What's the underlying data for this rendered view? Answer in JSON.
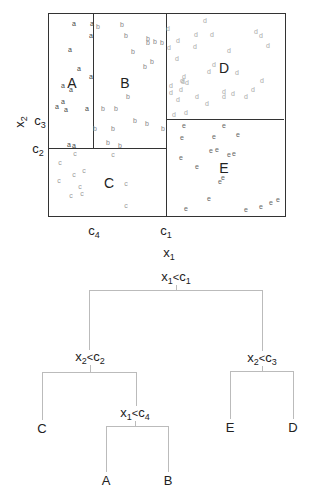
{
  "figure": {
    "partition_plot": {
      "box": {
        "left": 48,
        "top": 13,
        "right": 286,
        "bottom": 217
      },
      "split_lines": [
        {
          "name": "c1-vertical",
          "x1": 166,
          "y1": 13,
          "x2": 166,
          "y2": 217
        },
        {
          "name": "c4-vertical",
          "x1": 93,
          "y1": 13,
          "x2": 93,
          "y2": 148
        },
        {
          "name": "c2-horizontal",
          "x1": 48,
          "y1": 148,
          "x2": 166,
          "y2": 148
        },
        {
          "name": "c3-horizontal",
          "x1": 166,
          "y1": 119,
          "x2": 284,
          "y2": 119
        }
      ],
      "region_labels": [
        {
          "id": "A",
          "text": "A",
          "x": 72,
          "y": 83
        },
        {
          "id": "B",
          "text": "B",
          "x": 125,
          "y": 83
        },
        {
          "id": "C",
          "text": "C",
          "x": 109,
          "y": 183
        },
        {
          "id": "D",
          "text": "D",
          "x": 224,
          "y": 68
        },
        {
          "id": "E",
          "text": "E",
          "x": 224,
          "y": 168
        }
      ],
      "axis_tick_labels": {
        "c1": {
          "base": "c",
          "sub": "1",
          "x": 166,
          "y": 231
        },
        "c4": {
          "base": "c",
          "sub": "4",
          "x": 94,
          "y": 231
        },
        "c2": {
          "base": "c",
          "sub": "2",
          "x": 38,
          "y": 149
        },
        "c3": {
          "base": "c",
          "sub": "3",
          "x": 40,
          "y": 121
        }
      },
      "axis_titles": {
        "x": {
          "base": "x",
          "sub": "1",
          "x": 169,
          "y": 253
        },
        "y": {
          "base": "x",
          "sub": "2",
          "x": 20,
          "y": 122
        }
      },
      "points": [
        {
          "c": "a",
          "x": 74,
          "y": 23
        },
        {
          "c": "a",
          "x": 92,
          "y": 23
        },
        {
          "c": "a",
          "x": 91,
          "y": 35
        },
        {
          "c": "a",
          "x": 70,
          "y": 49
        },
        {
          "c": "a",
          "x": 79,
          "y": 68
        },
        {
          "c": "a",
          "x": 91,
          "y": 76
        },
        {
          "c": "a",
          "x": 63,
          "y": 85
        },
        {
          "c": "a",
          "x": 71,
          "y": 89
        },
        {
          "c": "a",
          "x": 63,
          "y": 101
        },
        {
          "c": "a",
          "x": 57,
          "y": 106
        },
        {
          "c": "a",
          "x": 66,
          "y": 109
        },
        {
          "c": "a",
          "x": 87,
          "y": 108
        },
        {
          "c": "a",
          "x": 69,
          "y": 144
        },
        {
          "c": "a",
          "x": 74,
          "y": 145
        },
        {
          "c": "b",
          "x": 98,
          "y": 26
        },
        {
          "c": "b",
          "x": 122,
          "y": 24
        },
        {
          "c": "b",
          "x": 126,
          "y": 35
        },
        {
          "c": "b",
          "x": 148,
          "y": 38
        },
        {
          "c": "b",
          "x": 148,
          "y": 42
        },
        {
          "c": "b",
          "x": 155,
          "y": 41
        },
        {
          "c": "b",
          "x": 162,
          "y": 42
        },
        {
          "c": "b",
          "x": 133,
          "y": 51
        },
        {
          "c": "b",
          "x": 152,
          "y": 61
        },
        {
          "c": "b",
          "x": 145,
          "y": 66
        },
        {
          "c": "b",
          "x": 128,
          "y": 96
        },
        {
          "c": "b",
          "x": 103,
          "y": 108
        },
        {
          "c": "b",
          "x": 116,
          "y": 108
        },
        {
          "c": "b",
          "x": 135,
          "y": 120
        },
        {
          "c": "b",
          "x": 147,
          "y": 123
        },
        {
          "c": "b",
          "x": 113,
          "y": 128
        },
        {
          "c": "b",
          "x": 95,
          "y": 128
        },
        {
          "c": "b",
          "x": 108,
          "y": 142
        },
        {
          "c": "b",
          "x": 120,
          "y": 145
        },
        {
          "c": "b",
          "x": 163,
          "y": 128
        },
        {
          "c": "c",
          "x": 75,
          "y": 153
        },
        {
          "c": "c",
          "x": 113,
          "y": 154
        },
        {
          "c": "c",
          "x": 60,
          "y": 162
        },
        {
          "c": "c",
          "x": 84,
          "y": 170
        },
        {
          "c": "c",
          "x": 74,
          "y": 174
        },
        {
          "c": "c",
          "x": 59,
          "y": 180
        },
        {
          "c": "c",
          "x": 126,
          "y": 183
        },
        {
          "c": "c",
          "x": 80,
          "y": 186
        },
        {
          "c": "c",
          "x": 82,
          "y": 193
        },
        {
          "c": "c",
          "x": 71,
          "y": 195
        },
        {
          "c": "c",
          "x": 126,
          "y": 205
        },
        {
          "c": "d",
          "x": 205,
          "y": 20
        },
        {
          "c": "d",
          "x": 168,
          "y": 28
        },
        {
          "c": "d",
          "x": 196,
          "y": 34
        },
        {
          "c": "d",
          "x": 212,
          "y": 34
        },
        {
          "c": "d",
          "x": 256,
          "y": 31
        },
        {
          "c": "d",
          "x": 261,
          "y": 35
        },
        {
          "c": "d",
          "x": 178,
          "y": 40
        },
        {
          "c": "d",
          "x": 195,
          "y": 46
        },
        {
          "c": "d",
          "x": 268,
          "y": 45
        },
        {
          "c": "d",
          "x": 169,
          "y": 47
        },
        {
          "c": "d",
          "x": 229,
          "y": 50
        },
        {
          "c": "d",
          "x": 177,
          "y": 58
        },
        {
          "c": "d",
          "x": 214,
          "y": 64
        },
        {
          "c": "d",
          "x": 209,
          "y": 71
        },
        {
          "c": "d",
          "x": 237,
          "y": 72
        },
        {
          "c": "d",
          "x": 184,
          "y": 76
        },
        {
          "c": "d",
          "x": 183,
          "y": 81
        },
        {
          "c": "d",
          "x": 187,
          "y": 82
        },
        {
          "c": "d",
          "x": 171,
          "y": 85
        },
        {
          "c": "d",
          "x": 182,
          "y": 80
        },
        {
          "c": "d",
          "x": 262,
          "y": 80
        },
        {
          "c": "d",
          "x": 181,
          "y": 89
        },
        {
          "c": "d",
          "x": 224,
          "y": 91
        },
        {
          "c": "d",
          "x": 233,
          "y": 93
        },
        {
          "c": "d",
          "x": 253,
          "y": 89
        },
        {
          "c": "d",
          "x": 246,
          "y": 96
        },
        {
          "c": "d",
          "x": 171,
          "y": 92
        },
        {
          "c": "d",
          "x": 178,
          "y": 99
        },
        {
          "c": "d",
          "x": 197,
          "y": 96
        },
        {
          "c": "d",
          "x": 224,
          "y": 96
        },
        {
          "c": "d",
          "x": 207,
          "y": 103
        },
        {
          "c": "d",
          "x": 186,
          "y": 112
        },
        {
          "c": "d",
          "x": 174,
          "y": 114
        },
        {
          "c": "e",
          "x": 184,
          "y": 125
        },
        {
          "c": "e",
          "x": 224,
          "y": 125
        },
        {
          "c": "e",
          "x": 238,
          "y": 134
        },
        {
          "c": "e",
          "x": 182,
          "y": 137
        },
        {
          "c": "e",
          "x": 214,
          "y": 136
        },
        {
          "c": "e",
          "x": 211,
          "y": 150
        },
        {
          "c": "e",
          "x": 217,
          "y": 149
        },
        {
          "c": "e",
          "x": 229,
          "y": 154
        },
        {
          "c": "e",
          "x": 234,
          "y": 153
        },
        {
          "c": "e",
          "x": 181,
          "y": 157
        },
        {
          "c": "e",
          "x": 197,
          "y": 166
        },
        {
          "c": "e",
          "x": 220,
          "y": 181
        },
        {
          "c": "e",
          "x": 223,
          "y": 177
        },
        {
          "c": "e",
          "x": 209,
          "y": 198
        },
        {
          "c": "e",
          "x": 186,
          "y": 208
        },
        {
          "c": "e",
          "x": 246,
          "y": 209
        },
        {
          "c": "e",
          "x": 261,
          "y": 206
        },
        {
          "c": "e",
          "x": 271,
          "y": 202
        },
        {
          "c": "e",
          "x": 278,
          "y": 199
        }
      ],
      "point_colors": {
        "a": "#444444",
        "b": "#888888",
        "c": "#999999",
        "d": "#aaaaaa",
        "e": "#666666"
      }
    },
    "tree": {
      "nodes": [
        {
          "id": "root",
          "var": "x",
          "var_sub": "1",
          "op": "<",
          "thr": "c",
          "thr_sub": "1",
          "x": 176,
          "y": 277
        },
        {
          "id": "left",
          "var": "x",
          "var_sub": "2",
          "op": "<",
          "thr": "c",
          "thr_sub": "2",
          "x": 90,
          "y": 357
        },
        {
          "id": "right",
          "var": "x",
          "var_sub": "2",
          "op": "<",
          "thr": "c",
          "thr_sub": "3",
          "x": 262,
          "y": 358
        },
        {
          "id": "left-right",
          "var": "x",
          "var_sub": "1",
          "op": "<",
          "thr": "c",
          "thr_sub": "4",
          "x": 135,
          "y": 413
        }
      ],
      "leaves": [
        {
          "id": "C",
          "text": "C",
          "x": 42,
          "y": 428
        },
        {
          "id": "E",
          "text": "E",
          "x": 230,
          "y": 427
        },
        {
          "id": "D",
          "text": "D",
          "x": 293,
          "y": 427
        },
        {
          "id": "A",
          "text": "A",
          "x": 106,
          "y": 480
        },
        {
          "id": "B",
          "text": "B",
          "x": 168,
          "y": 480
        }
      ],
      "edges": [
        {
          "type": "v",
          "x": 176,
          "y1": 285,
          "y2": 290
        },
        {
          "type": "h",
          "y": 290,
          "x1": 89,
          "x2": 262
        },
        {
          "type": "v",
          "x": 89,
          "y1": 290,
          "y2": 350
        },
        {
          "type": "v",
          "x": 262,
          "y1": 290,
          "y2": 351
        },
        {
          "type": "v",
          "x": 90,
          "y1": 365,
          "y2": 372
        },
        {
          "type": "h",
          "y": 372,
          "x1": 42,
          "x2": 136
        },
        {
          "type": "v",
          "x": 42,
          "y1": 372,
          "y2": 420
        },
        {
          "type": "v",
          "x": 136,
          "y1": 372,
          "y2": 406
        },
        {
          "type": "v",
          "x": 262,
          "y1": 366,
          "y2": 371
        },
        {
          "type": "h",
          "y": 371,
          "x1": 230,
          "x2": 293
        },
        {
          "type": "v",
          "x": 230,
          "y1": 371,
          "y2": 419
        },
        {
          "type": "v",
          "x": 293,
          "y1": 371,
          "y2": 419
        },
        {
          "type": "v",
          "x": 135,
          "y1": 421,
          "y2": 426
        },
        {
          "type": "h",
          "y": 426,
          "x1": 106,
          "x2": 168
        },
        {
          "type": "v",
          "x": 106,
          "y1": 426,
          "y2": 472
        },
        {
          "type": "v",
          "x": 168,
          "y1": 426,
          "y2": 472
        }
      ]
    }
  }
}
